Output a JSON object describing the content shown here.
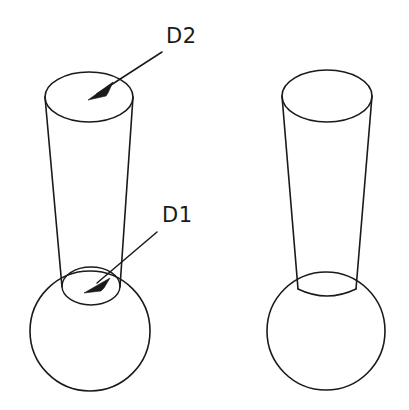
{
  "diagram": {
    "background_color": "#ffffff",
    "line_color": "#1a1a1a",
    "figures": [
      {
        "name": "labelled-figure",
        "position": "left",
        "description": "Tapered cone on sphere with visible D1 opening ellipse",
        "has_callouts": true
      },
      {
        "name": "unlabelled-figure",
        "position": "right",
        "description": "Tapered cone on sphere without callout labels",
        "has_callouts": false
      }
    ],
    "callouts": [
      {
        "name": "callout-d2",
        "label": "D2",
        "label_x": 166,
        "label_y": 43,
        "leader_start_x": 162,
        "leader_start_y": 52,
        "arrow_tip_x": 91,
        "arrow_tip_y": 97,
        "target": "cone-top-diameter"
      },
      {
        "name": "callout-d1",
        "label": "D1",
        "label_x": 162,
        "label_y": 222,
        "leader_start_x": 157,
        "leader_start_y": 232,
        "arrow_tip_x": 88,
        "arrow_tip_y": 288,
        "target": "cone-base-opening-diameter"
      }
    ],
    "geometry": {
      "left": {
        "sphere_cx": 90,
        "sphere_cy": 331,
        "sphere_r": 60,
        "top_ellipse_cx": 89,
        "top_ellipse_cy": 97,
        "top_ellipse_rx": 44,
        "top_ellipse_ry": 25,
        "base_ellipse_cx": 91,
        "base_ellipse_cy": 286,
        "base_ellipse_rx": 29,
        "base_ellipse_ry": 19
      },
      "right": {
        "sphere_cx": 326,
        "sphere_cy": 331,
        "sphere_r": 59,
        "top_ellipse_cx": 327,
        "top_ellipse_cy": 96,
        "top_ellipse_rx": 45,
        "top_ellipse_ry": 26,
        "base_ellipse_cx": 327,
        "base_ellipse_cy": 283,
        "base_ellipse_rx": 29,
        "base_ellipse_ry": 19
      }
    }
  }
}
